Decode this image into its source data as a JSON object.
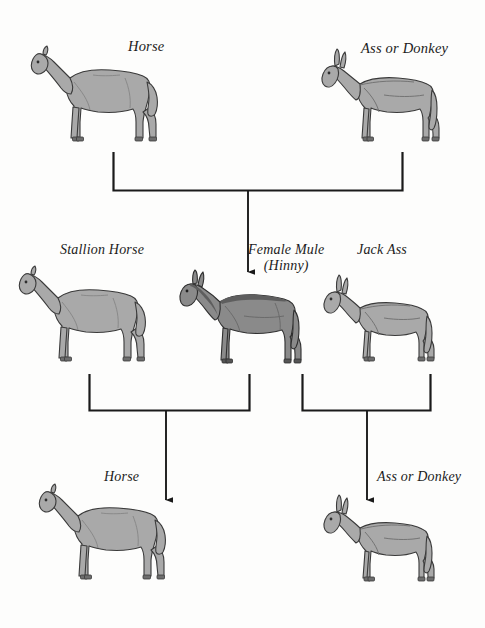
{
  "diagram": {
    "background_color": "#fdfdfc",
    "line_color": "#1a1a1a",
    "generations": [
      {
        "name": "parent-generation",
        "nodes": [
          {
            "id": "p1",
            "label": "Horse",
            "species": "horse",
            "shade": "light"
          },
          {
            "id": "p2",
            "label": "Ass or Donkey",
            "species": "donkey",
            "shade": "light"
          }
        ]
      },
      {
        "name": "f1-and-backcross-parents",
        "nodes": [
          {
            "id": "f1a",
            "label": "Stallion Horse",
            "species": "horse",
            "shade": "light"
          },
          {
            "id": "f1b",
            "label_line1": "Female Mule",
            "label_line2": "(Hinny)",
            "species": "mule",
            "shade": "dark"
          },
          {
            "id": "f1c",
            "label": "Jack Ass",
            "species": "donkey",
            "shade": "light"
          }
        ]
      },
      {
        "name": "offspring-generation",
        "nodes": [
          {
            "id": "o1",
            "label": "Horse",
            "species": "horse",
            "shade": "light"
          },
          {
            "id": "o2",
            "label": "Ass or Donkey",
            "species": "donkey",
            "shade": "light"
          }
        ]
      }
    ],
    "crosses": [
      {
        "id": "cross-1",
        "parents": [
          "p1",
          "p2"
        ],
        "offspring": "f1b"
      },
      {
        "id": "cross-2",
        "parents": [
          "f1a",
          "f1b"
        ],
        "offspring": "o1"
      },
      {
        "id": "cross-3",
        "parents": [
          "f1b",
          "f1c"
        ],
        "offspring": "o2"
      }
    ]
  },
  "colors": {
    "body_light": "#a9a9a9",
    "body_dark": "#8a8a8a",
    "outline": "#3a3a3a",
    "hoof": "#6d6d6d",
    "line": "#1a1a1a",
    "page": "#fdfdfc"
  }
}
